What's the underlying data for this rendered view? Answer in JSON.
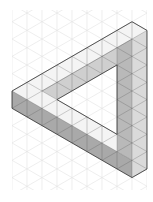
{
  "figure": {
    "colors": {
      "background": "#ffffff",
      "grid": "#e2e2e2",
      "top_face": "#f4f4f4",
      "underside_face": "#cfcfcf",
      "inner_side_face": "#b9b9b9",
      "right_face": "#dadada",
      "front_face": "#a9a9a9",
      "outline": "#444444"
    },
    "grid": {
      "x0": 12,
      "x1": 147,
      "y0": 10,
      "y1": 190,
      "dx": 15,
      "dy": 8.66
    },
    "faces": [
      {
        "name": "top-bar-top-face",
        "fill": "top_face",
        "points": "12,91 132,21.7 147,30.4 132,39 42,91"
      },
      {
        "name": "lower-bar-top-face",
        "fill": "top_face",
        "points": "12,91 42,91 117,134.3 117,151.6 132,160.3"
      },
      {
        "name": "top-bar-underside",
        "fill": "underside_face",
        "points": "42,91 132,39 117,47.7 117,65 57,99.6"
      },
      {
        "name": "right-bar-inner-face",
        "fill": "inner_side_face",
        "points": "117,47.7 132,39 132,160.3 117,151.6"
      },
      {
        "name": "right-bar-right-face",
        "fill": "right_face",
        "points": "132,39 147,30.4 147,169 132,177.6"
      },
      {
        "name": "lower-bar-front-face",
        "fill": "front_face",
        "points": "12,91 132,160.3 132,177.6 12,108.3"
      }
    ],
    "outline": "12,91 132,21.7 147,30.4 147,169 132,177.6 12,108.3 12,91",
    "inner_outline": "57,99.6 117,65 117,134.3 57,99.6"
  }
}
